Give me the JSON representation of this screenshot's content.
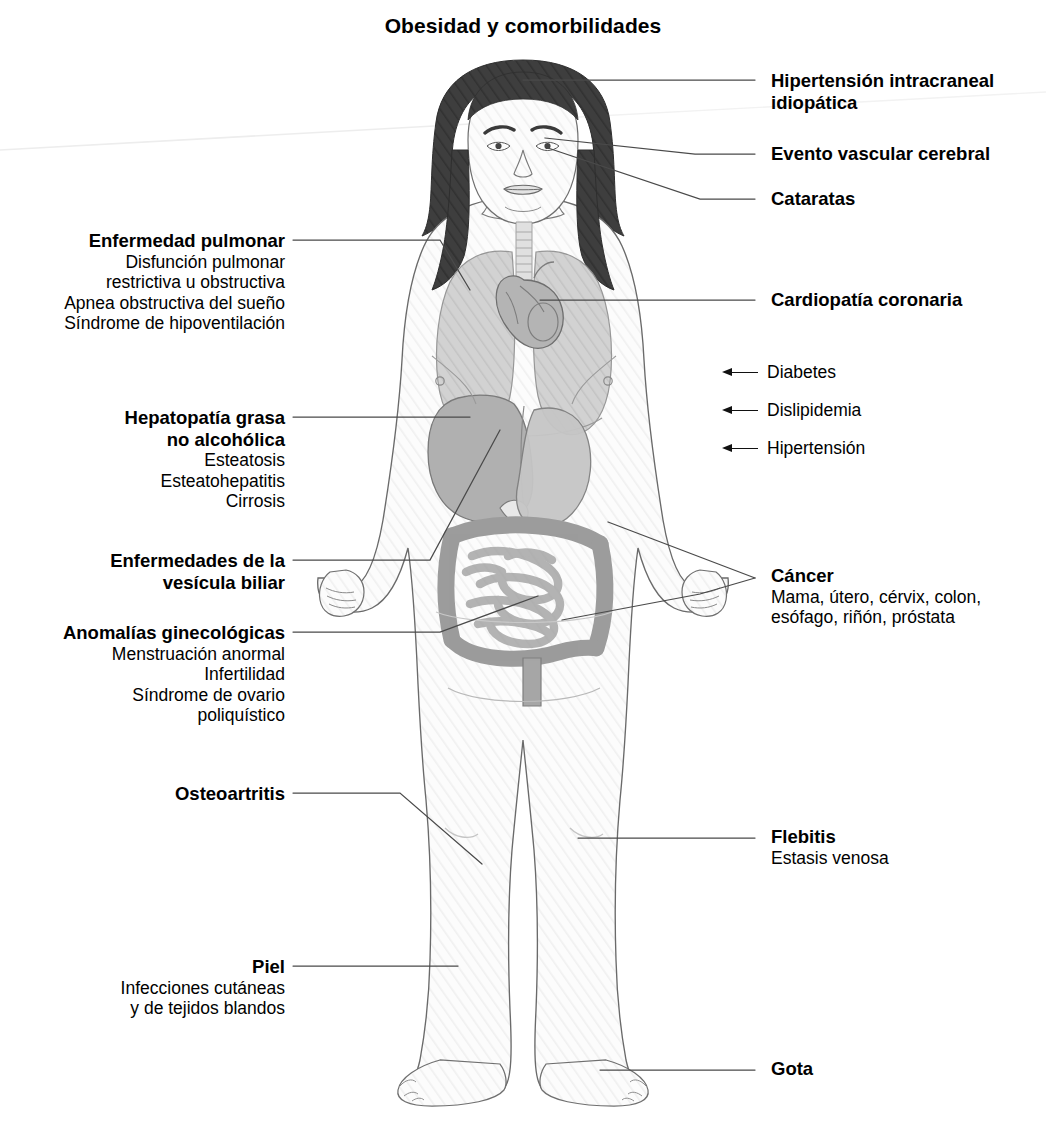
{
  "title": "Obesidad y comorbilidades",
  "figure": {
    "colors": {
      "outline": "#5a5a5a",
      "skin_fill": "#fbfbfb",
      "hair": "#3b3b3b",
      "organ_light": "#d9d9d9",
      "organ_mid": "#c2c2c2",
      "organ_dark": "#a8a8a8",
      "leader_line": "#4a4a4a"
    }
  },
  "callouts": {
    "right": [
      {
        "id": "hipertension-intracraneal",
        "heading": [
          "Hipertensión intracraneal",
          "idiopática"
        ],
        "sub": []
      },
      {
        "id": "evento-vascular-cerebral",
        "heading": [
          "Evento vascular cerebral"
        ],
        "sub": []
      },
      {
        "id": "cataratas",
        "heading": [
          "Cataratas"
        ],
        "sub": []
      },
      {
        "id": "cardiopatia-coronaria",
        "heading": [
          "Cardiopatía coronaria"
        ],
        "sub": []
      },
      {
        "id": "cancer",
        "heading": [
          "Cáncer"
        ],
        "sub": [
          "Mama, útero, cérvix, colon,",
          "esófago, riñón, próstata"
        ]
      },
      {
        "id": "flebitis",
        "heading": [
          "Flebitis"
        ],
        "sub": [
          "Estasis venosa"
        ]
      },
      {
        "id": "gota",
        "heading": [
          "Gota"
        ],
        "sub": []
      }
    ],
    "right_arrows": [
      {
        "id": "diabetes",
        "label": "Diabetes",
        "icon": "left-arrow-icon"
      },
      {
        "id": "dislipidemia",
        "label": "Dislipidemia",
        "icon": "left-arrow-icon"
      },
      {
        "id": "hipertension",
        "label": "Hipertensión",
        "icon": "left-arrow-icon"
      }
    ],
    "left": [
      {
        "id": "enfermedad-pulmonar",
        "heading": [
          "Enfermedad pulmonar"
        ],
        "sub": [
          "Disfunción pulmonar",
          "restrictiva u obstructiva",
          "Apnea obstructiva del sueño",
          "Síndrome de hipoventilación"
        ]
      },
      {
        "id": "hepatopatia-grasa",
        "heading": [
          "Hepatopatía grasa",
          "no alcohólica"
        ],
        "sub": [
          "Esteatosis",
          "Esteatohepatitis",
          "Cirrosis"
        ]
      },
      {
        "id": "enfermedades-vesicula-biliar",
        "heading": [
          "Enfermedades de la",
          "vesícula biliar"
        ],
        "sub": []
      },
      {
        "id": "anomalias-ginecologicas",
        "heading": [
          "Anomalías ginecológicas"
        ],
        "sub": [
          "Menstruación anormal",
          "Infertilidad",
          "Síndrome de ovario",
          "poliquístico"
        ]
      },
      {
        "id": "osteoartritis",
        "heading": [
          "Osteoartritis"
        ],
        "sub": []
      },
      {
        "id": "piel",
        "heading": [
          "Piel"
        ],
        "sub": [
          "Infecciones cutáneas",
          "y de tejidos blandos"
        ]
      }
    ]
  }
}
